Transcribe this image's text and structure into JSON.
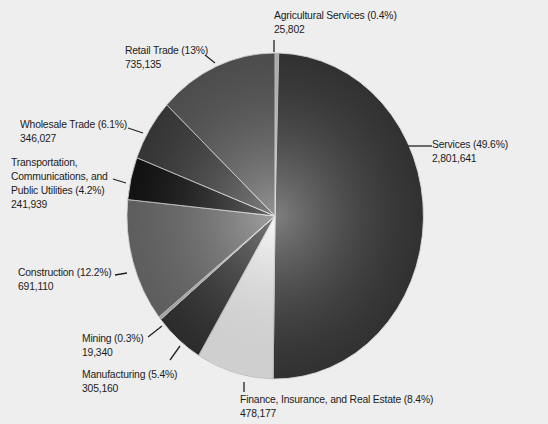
{
  "chart_data": {
    "type": "pie",
    "title": "",
    "unit": "count",
    "slices": [
      {
        "name": "Agricultural Services",
        "percent": 0.4,
        "value": 25802,
        "label": "Agricultural Services (0.4%)",
        "value_label": "25,802",
        "color": "#c8c8c8"
      },
      {
        "name": "Services",
        "percent": 49.6,
        "value": 2801641,
        "label": "Services (49.6%)",
        "value_label": "2,801,641",
        "color": "#3a3a3a"
      },
      {
        "name": "Finance, Insurance, and Real Estate",
        "percent": 8.4,
        "value": 478177,
        "label": "Finance, Insurance, and Real Estate (8.4%)",
        "value_label": "478,177",
        "color": "#f4f4f4"
      },
      {
        "name": "Manufacturing",
        "percent": 5.4,
        "value": 305160,
        "label": "Manufacturing (5.4%)",
        "value_label": "305,160",
        "color": "#333333"
      },
      {
        "name": "Mining",
        "percent": 0.3,
        "value": 19340,
        "label": "Mining (0.3%)",
        "value_label": "19,340",
        "color": "#bdbdbd"
      },
      {
        "name": "Construction",
        "percent": 12.2,
        "value": 691110,
        "label": "Construction (12.2%)",
        "value_label": "691,110",
        "color": "#6e6e6e"
      },
      {
        "name": "Transportation, Communications, and Public Utilities",
        "percent": 4.2,
        "value": 241939,
        "label": "Transportation, Communications, and Public Utilities (4.2%)",
        "value_label": "241,939",
        "color": "#141414"
      },
      {
        "name": "Wholesale Trade",
        "percent": 6.1,
        "value": 346027,
        "label": "Wholesale Trade (6.1%)",
        "value_label": "346,027",
        "color": "#3e3e3e"
      },
      {
        "name": "Retail Trade",
        "percent": 13,
        "value": 735135,
        "label": "Retail Trade (13%)",
        "value_label": "735,135",
        "color": "#5a5a5a"
      }
    ],
    "start_angle_deg": 0,
    "direction": "clockwise",
    "legend": "none (callout labels)"
  },
  "labels": {
    "agricultural": {
      "line1": "Agricultural Services (0.4%)",
      "line2": "25,802"
    },
    "services": {
      "line1": "Services (49.6%)",
      "line2": "2,801,641"
    },
    "finance": {
      "line1": "Finance, Insurance, and Real Estate (8.4%)",
      "line2": "478,177"
    },
    "manufacturing": {
      "line1": "Manufacturing (5.4%)",
      "line2": "305,160"
    },
    "mining": {
      "line1": "Mining (0.3%)",
      "line2": "19,340"
    },
    "construction": {
      "line1": "Construction (12.2%)",
      "line2": "691,110"
    },
    "transportation": {
      "line1": "Transportation,",
      "line2": "Communications, and",
      "line3": "Public Utilities (4.2%)",
      "line4": "241,939"
    },
    "wholesale": {
      "line1": "Wholesale Trade (6.1%)",
      "line2": "346,027"
    },
    "retail": {
      "line1": "Retail Trade (13%)",
      "line2": "735,135"
    }
  }
}
